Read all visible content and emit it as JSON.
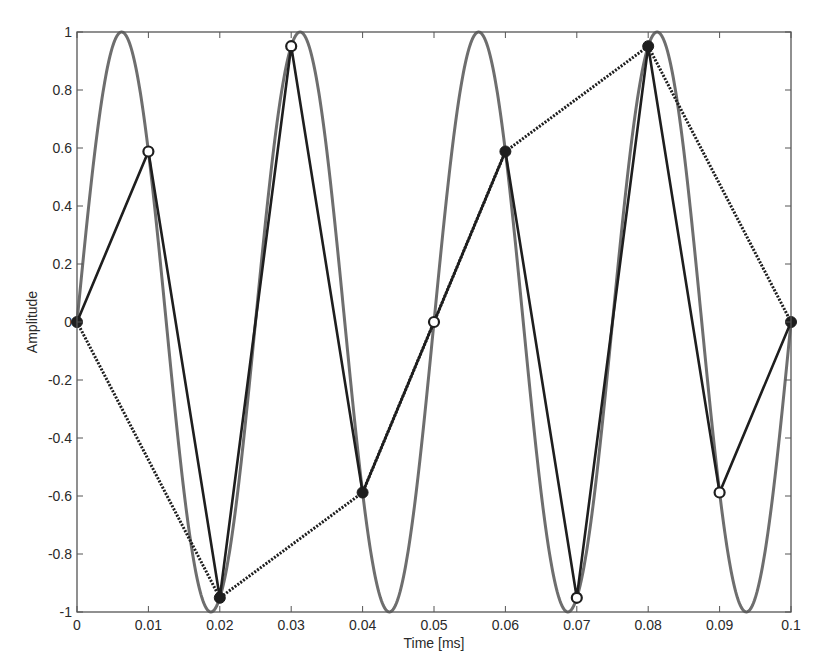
{
  "chart_data": {
    "type": "line",
    "title": "",
    "xlabel": "Time [ms]",
    "ylabel": "Amplitude",
    "xlim": [
      0,
      0.1
    ],
    "ylim": [
      -1,
      1
    ],
    "grid": false,
    "legend": null,
    "xticks": [
      0,
      0.01,
      0.02,
      0.03,
      0.04,
      0.05,
      0.06,
      0.07,
      0.08,
      0.09,
      0.1
    ],
    "xtick_labels": [
      "0",
      "0.01",
      "0.02",
      "0.03",
      "0.04",
      "0.05",
      "0.06",
      "0.07",
      "0.08",
      "0.09",
      "0.1"
    ],
    "yticks": [
      -1,
      -0.8,
      -0.6,
      -0.4,
      -0.2,
      0,
      0.2,
      0.4,
      0.6,
      0.8,
      1
    ],
    "ytick_labels": [
      "-1",
      "-0.8",
      "-0.6",
      "-0.4",
      "-0.2",
      "0",
      "0.2",
      "0.4",
      "0.6",
      "0.8",
      "1"
    ],
    "series": [
      {
        "name": "continuous sine (40 kHz)",
        "style": "solid thick gray",
        "color": "#6e6e6e",
        "function": "sin(2*pi*40*t), t in ms",
        "frequency_khz": 40,
        "period_ms": 0.025
      },
      {
        "name": "sampled every 0.01 ms",
        "style": "solid dark with open circle markers",
        "color": "#1e1e1e",
        "x": [
          0,
          0.01,
          0.02,
          0.03,
          0.04,
          0.05,
          0.06,
          0.07,
          0.08,
          0.09,
          0.1
        ],
        "values": [
          0,
          0.588,
          -0.951,
          0.951,
          -0.588,
          0,
          0.588,
          -0.951,
          0.951,
          -0.588,
          0
        ]
      },
      {
        "name": "sampled every 0.02 ms",
        "style": "dotted dark with filled circle markers",
        "color": "#1e1e1e",
        "x": [
          0,
          0.02,
          0.04,
          0.06,
          0.08,
          0.1
        ],
        "values": [
          0,
          -0.951,
          -0.588,
          0.588,
          0.951,
          0
        ]
      }
    ]
  }
}
